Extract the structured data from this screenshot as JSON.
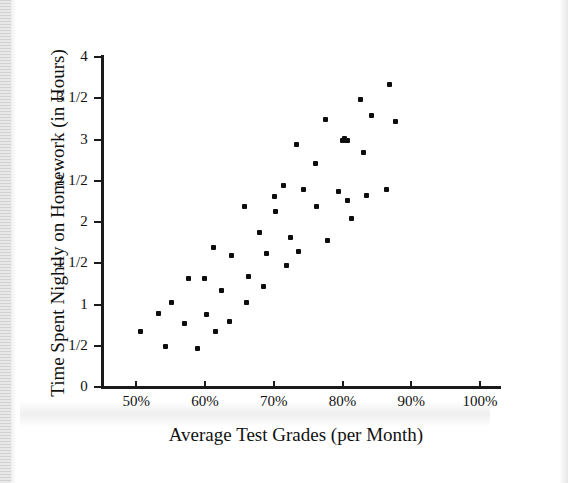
{
  "chart_data": {
    "type": "scatter",
    "title": "",
    "xlabel": "Average Test Grades (per Month)",
    "ylabel": "Time Spent Nightly on Homework (in Hours)",
    "xlim": [
      45,
      100
    ],
    "ylim": [
      0,
      4
    ],
    "grid": false,
    "legend": null,
    "x_tick_labels": [
      "50%",
      "60%",
      "70%",
      "80%",
      "90%",
      "100%"
    ],
    "x_tick_values": [
      50,
      60,
      70,
      80,
      90,
      100
    ],
    "y_tick_labels": [
      "0",
      "1/2",
      "1",
      "1 1/2",
      "2",
      "2 1/2",
      "3",
      "3 1/2",
      "4"
    ],
    "y_tick_values": [
      0,
      0.5,
      1,
      1.5,
      2,
      2.5,
      3,
      3.5,
      4
    ],
    "marker": "square",
    "marker_color": "#0d0d0d",
    "points": [
      {
        "x": 50.6,
        "y": 0.68
      },
      {
        "x": 53.2,
        "y": 0.9
      },
      {
        "x": 54.1,
        "y": 0.5
      },
      {
        "x": 55.1,
        "y": 1.03
      },
      {
        "x": 57.0,
        "y": 0.78
      },
      {
        "x": 57.5,
        "y": 1.32
      },
      {
        "x": 58.8,
        "y": 0.47
      },
      {
        "x": 59.9,
        "y": 1.32
      },
      {
        "x": 60.2,
        "y": 0.88
      },
      {
        "x": 61.2,
        "y": 1.7
      },
      {
        "x": 61.4,
        "y": 0.68
      },
      {
        "x": 62.3,
        "y": 1.18
      },
      {
        "x": 63.5,
        "y": 0.8
      },
      {
        "x": 63.8,
        "y": 1.6
      },
      {
        "x": 65.6,
        "y": 2.2
      },
      {
        "x": 66.0,
        "y": 1.03
      },
      {
        "x": 66.3,
        "y": 1.35
      },
      {
        "x": 67.8,
        "y": 1.88
      },
      {
        "x": 68.4,
        "y": 1.22
      },
      {
        "x": 68.8,
        "y": 1.63
      },
      {
        "x": 70.0,
        "y": 2.32
      },
      {
        "x": 70.2,
        "y": 2.13
      },
      {
        "x": 71.4,
        "y": 2.45
      },
      {
        "x": 71.7,
        "y": 1.48
      },
      {
        "x": 72.3,
        "y": 1.82
      },
      {
        "x": 73.2,
        "y": 2.95
      },
      {
        "x": 73.5,
        "y": 1.65
      },
      {
        "x": 74.3,
        "y": 2.4
      },
      {
        "x": 76.0,
        "y": 2.72
      },
      {
        "x": 76.2,
        "y": 2.2
      },
      {
        "x": 77.5,
        "y": 3.25
      },
      {
        "x": 77.8,
        "y": 1.78
      },
      {
        "x": 79.4,
        "y": 2.38
      },
      {
        "x": 80.2,
        "y": 3.02
      },
      {
        "x": 80.5,
        "y": 3.0
      },
      {
        "x": 80.7,
        "y": 2.27
      },
      {
        "x": 81.3,
        "y": 2.05
      },
      {
        "x": 82.6,
        "y": 3.49
      },
      {
        "x": 83.0,
        "y": 2.85
      },
      {
        "x": 83.4,
        "y": 2.33
      },
      {
        "x": 84.2,
        "y": 3.3
      },
      {
        "x": 86.3,
        "y": 2.4
      },
      {
        "x": 86.8,
        "y": 3.67
      },
      {
        "x": 87.6,
        "y": 3.22
      }
    ]
  },
  "axes": {
    "y_ticks": [
      {
        "label": "4",
        "value": 4.0
      },
      {
        "label": "3 1/2",
        "value": 3.5
      },
      {
        "label": "3",
        "value": 3.0
      },
      {
        "label": "2 1/2",
        "value": 2.5
      },
      {
        "label": "2",
        "value": 2.0
      },
      {
        "label": "1 1/2",
        "value": 1.5
      },
      {
        "label": "1",
        "value": 1.0
      },
      {
        "label": "1/2",
        "value": 0.5
      },
      {
        "label": "0",
        "value": 0.0
      }
    ],
    "x_ticks": [
      {
        "label": "50%",
        "value": 50
      },
      {
        "label": "60%",
        "value": 60
      },
      {
        "label": "70%",
        "value": 70
      },
      {
        "label": "80%",
        "value": 80
      },
      {
        "label": "90%",
        "value": 90
      },
      {
        "label": "100%",
        "value": 100
      }
    ]
  }
}
